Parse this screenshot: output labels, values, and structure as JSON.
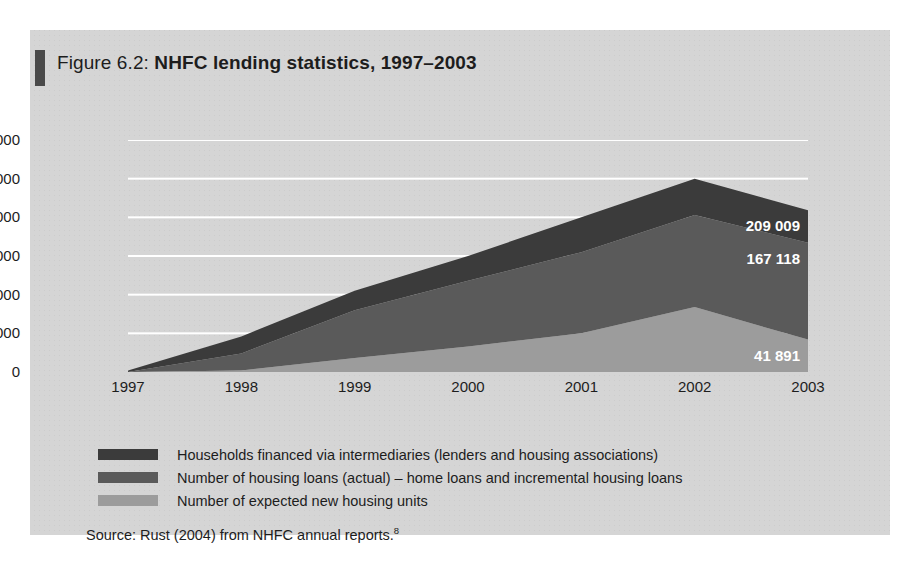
{
  "figure": {
    "label": "Figure 6.2:",
    "title": "NHFC lending statistics, 1997–2003",
    "source": "Source: Rust (2004) from NHFC annual reports.",
    "source_footnote": "8"
  },
  "colors": {
    "panel_background": "#d5d5d5",
    "series_dark": "#3b3b3b",
    "series_medium": "#5a5a5a",
    "series_light": "#9c9c9c",
    "gridline": "#ffffff",
    "text": "#1d1d1d",
    "label_text": "#ffffff",
    "title_bar": "#4a4a4a"
  },
  "legend": {
    "position": "below-plot",
    "items": [
      {
        "color": "#3b3b3b",
        "label": "Households financed via intermediaries (lenders and housing associations)"
      },
      {
        "color": "#5a5a5a",
        "label": "Number of housing loans (actual) – home loans and incremental housing loans"
      },
      {
        "color": "#9c9c9c",
        "label": "Number of expected new housing units"
      }
    ]
  },
  "chart_data": {
    "type": "area",
    "stacked": true,
    "title": "NHFC lending statistics, 1997–2003",
    "xlabel": "",
    "ylabel": "",
    "categories": [
      "1997",
      "1998",
      "1999",
      "2000",
      "2001",
      "2002",
      "2003"
    ],
    "x_tick_labels": [
      "1997",
      "1998",
      "1999",
      "2000",
      "2001",
      "2002",
      "2003"
    ],
    "y_tick_labels": [
      "0",
      "50 000",
      "100 000",
      "150 000",
      "200 000",
      "250 000",
      "300 000"
    ],
    "y_tick_values": [
      0,
      50000,
      100000,
      150000,
      200000,
      250000,
      300000
    ],
    "ylim": [
      0,
      300000
    ],
    "grid": true,
    "grid_axis": "y",
    "series": [
      {
        "name": "Number of expected new housing units",
        "color": "#9c9c9c",
        "values": [
          0,
          2000,
          18000,
          33000,
          50000,
          84000,
          41891
        ]
      },
      {
        "name": "Number of housing loans (actual) – home loans and incremental housing loans",
        "color": "#5a5a5a",
        "values": [
          0,
          22000,
          62000,
          85000,
          105000,
          119000,
          125227
        ]
      },
      {
        "name": "Households financed via intermediaries (lenders and housing associations)",
        "color": "#3b3b3b",
        "values": [
          2000,
          22000,
          25000,
          32000,
          45000,
          47000,
          41891
        ]
      }
    ],
    "cumulative_totals": [
      2000,
      46000,
      105000,
      150000,
      200000,
      250000,
      209009
    ],
    "data_labels": [
      {
        "text": "209 009",
        "series": "cumulative total 2003",
        "value": 209009,
        "x": "2003"
      },
      {
        "text": "167 118",
        "series": "lower two series total 2003",
        "value": 167118,
        "x": "2003"
      },
      {
        "text": "41 891",
        "series": "expected new housing units 2003",
        "value": 41891,
        "x": "2003"
      }
    ]
  }
}
